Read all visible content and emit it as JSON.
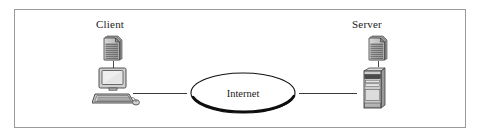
{
  "diagram": {
    "frame": {
      "border_color": "#9a9a9a",
      "background": "#ffffff"
    },
    "nodes": [
      {
        "id": "client",
        "label": "Client",
        "icon": "desktop-computer-icon",
        "document_icon": "document-icon",
        "side": "left"
      },
      {
        "id": "server",
        "label": "Server",
        "icon": "server-tower-icon",
        "document_icon": "document-icon",
        "side": "right"
      }
    ],
    "cloud": {
      "label": "Internet",
      "shape": "ellipse",
      "outline_color": "#1a1a1a",
      "fill": "#ffffff"
    },
    "links": [
      {
        "id": "client-to-internet",
        "from": "client",
        "to": "cloud",
        "style": "solid"
      },
      {
        "id": "internet-to-server",
        "from": "cloud",
        "to": "server",
        "style": "solid"
      }
    ],
    "colors": {
      "line": "#3a3a3a",
      "text": "#1b1b1b",
      "icon_fill": "#c9c9c9",
      "icon_stroke": "#4a4a4a"
    }
  }
}
